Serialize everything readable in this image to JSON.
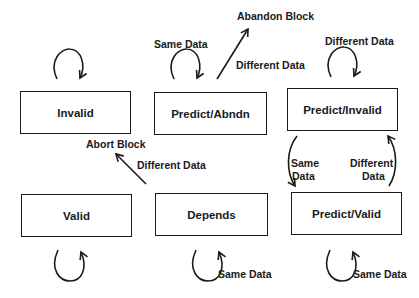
{
  "diagram": {
    "type": "state-transition",
    "states": [
      {
        "id": "invalid",
        "label": "Invalid"
      },
      {
        "id": "predict_abndn",
        "label": "Predict/Abndn"
      },
      {
        "id": "predict_invalid",
        "label": "Predict/Invalid"
      },
      {
        "id": "valid",
        "label": "Valid"
      },
      {
        "id": "depends",
        "label": "Depends"
      },
      {
        "id": "predict_valid",
        "label": "Predict/Valid"
      }
    ],
    "transitions": [
      {
        "from": "invalid",
        "to": "invalid",
        "label": ""
      },
      {
        "from": "predict_abndn",
        "to": "predict_abndn",
        "label": "Same Data"
      },
      {
        "from": "predict_abndn",
        "to": "abandon_block",
        "label": "Different Data"
      },
      {
        "from": "predict_invalid",
        "to": "predict_invalid",
        "label": "Different Data"
      },
      {
        "from": "predict_invalid",
        "to": "predict_valid",
        "label": "Same Data"
      },
      {
        "from": "predict_valid",
        "to": "predict_invalid",
        "label": "Different Data"
      },
      {
        "from": "depends",
        "to": "abort_block",
        "label": "Different Data"
      },
      {
        "from": "valid",
        "to": "valid",
        "label": ""
      },
      {
        "from": "depends",
        "to": "depends",
        "label": "Same Data"
      },
      {
        "from": "predict_valid",
        "to": "predict_valid",
        "label": "Same Data"
      }
    ],
    "labels": {
      "abandon_block": "Abandon Block",
      "abort_block": "Abort Block",
      "abndn_same": "Same Data",
      "abndn_diff": "Different Data",
      "pinv_diff": "Different Data",
      "pinv_same_1": "Same",
      "pinv_same_2": "Data",
      "pval_diff_1": "Different",
      "pval_diff_2": "Data",
      "depends_diff": "Different Data",
      "depends_same": "Same Data",
      "pval_same": "Same Data"
    }
  }
}
